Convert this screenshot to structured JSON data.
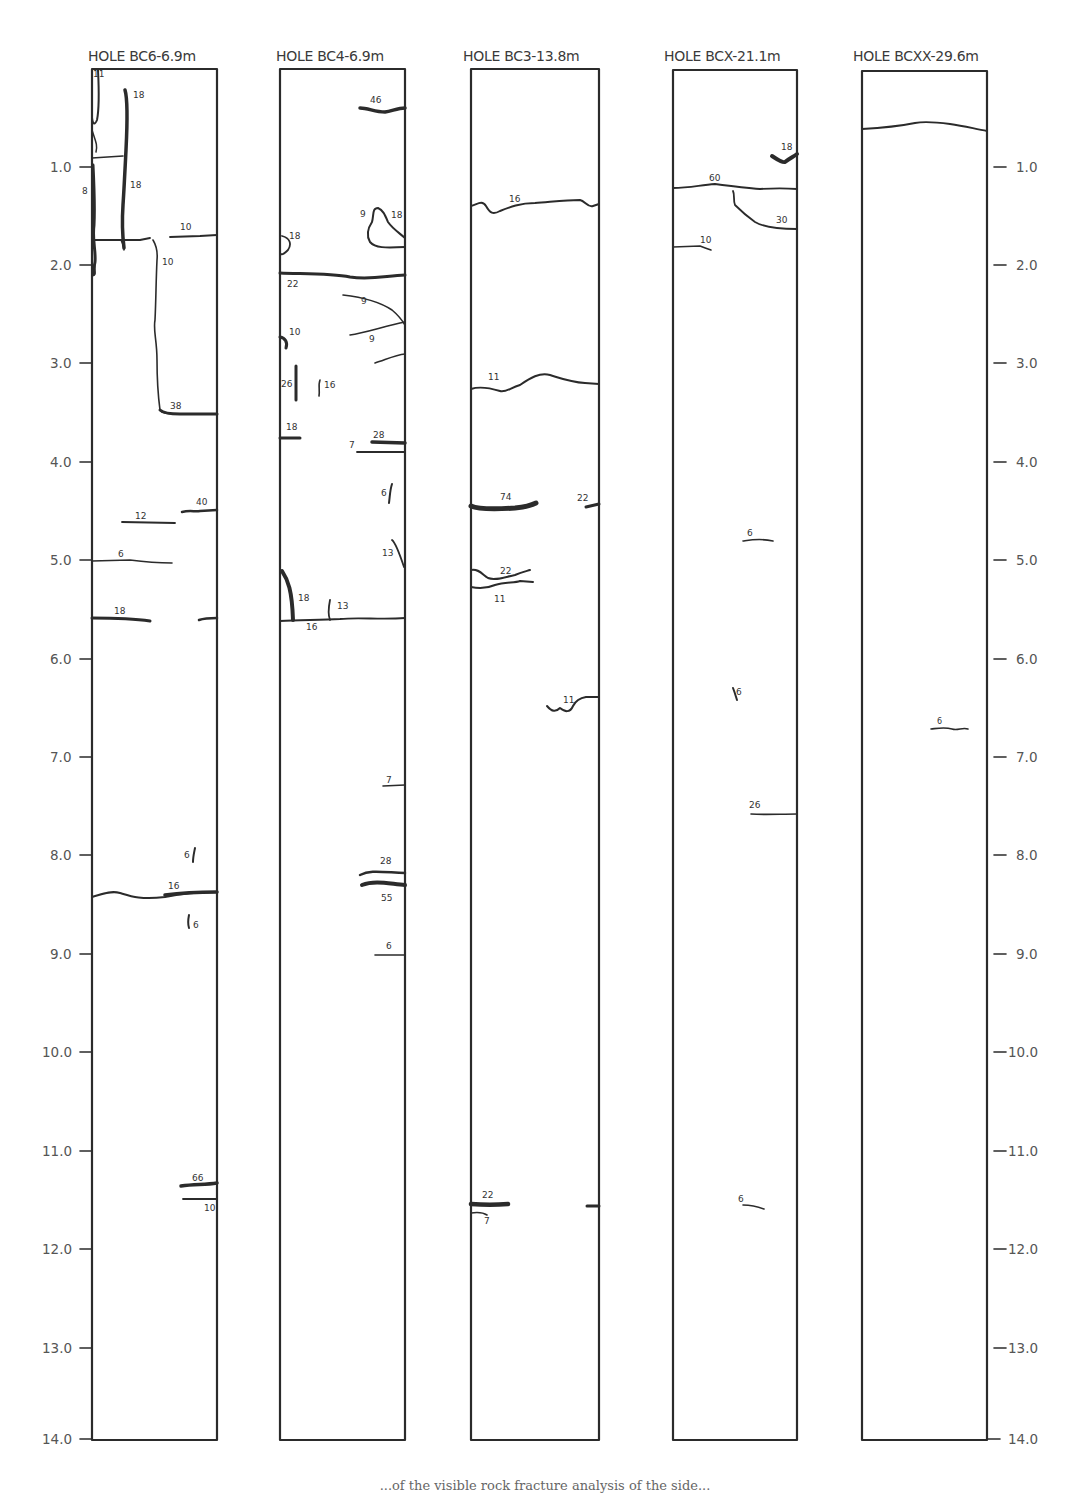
{
  "figure": {
    "type": "borehole-fracture-log",
    "depth_unit": "m",
    "depth_range": [
      0.0,
      14.0
    ],
    "left_axis_ticks": [
      "1.0",
      "2.0",
      "3.0",
      "4.0",
      "5.0",
      "6.0",
      "7.0",
      "8.0",
      "9.0",
      "10.0",
      "11.0",
      "12.0",
      "13.0",
      "14.0"
    ],
    "right_axis_ticks": [
      "1.0",
      "2.0",
      "3.0",
      "4.0",
      "5.0",
      "6.0",
      "7.0",
      "8.0",
      "9.0",
      "10.0",
      "11.0",
      "12.0",
      "13.0",
      "14.0"
    ],
    "caption": "...of the visible rock fracture analysis of the side..."
  },
  "holes": [
    {
      "id": "BC6",
      "title": "HOLE  BC6-6.9m",
      "fractures": [
        {
          "label": "11",
          "depth": 0.0
        },
        {
          "label": "18",
          "depth": 0.2
        },
        {
          "label": "18",
          "depth": 1.2
        },
        {
          "label": "8",
          "depth": 1.2
        },
        {
          "label": "10",
          "depth": 1.7
        },
        {
          "label": "10",
          "depth": 1.9
        },
        {
          "label": "38",
          "depth": 3.5
        },
        {
          "label": "40",
          "depth": 4.5
        },
        {
          "label": "12",
          "depth": 4.6
        },
        {
          "label": "6",
          "depth": 5.0
        },
        {
          "label": "18",
          "depth": 5.6
        },
        {
          "label": "6",
          "depth": 8.0
        },
        {
          "label": "16",
          "depth": 8.4
        },
        {
          "label": "6",
          "depth": 8.6
        },
        {
          "label": "66",
          "depth": 11.4
        },
        {
          "label": "10",
          "depth": 11.5
        }
      ]
    },
    {
      "id": "BC4",
      "title": "HOLE  BC4-6.9m",
      "fractures": [
        {
          "label": "46",
          "depth": 0.4
        },
        {
          "label": "9",
          "depth": 1.5
        },
        {
          "label": "18",
          "depth": 1.5
        },
        {
          "label": "18",
          "depth": 1.8
        },
        {
          "label": "22",
          "depth": 2.1
        },
        {
          "label": "9",
          "depth": 2.4
        },
        {
          "label": "9",
          "depth": 2.7
        },
        {
          "label": "10",
          "depth": 2.8
        },
        {
          "label": "26",
          "depth": 3.2
        },
        {
          "label": "16",
          "depth": 3.2
        },
        {
          "label": "18",
          "depth": 3.7
        },
        {
          "label": "28",
          "depth": 3.8
        },
        {
          "label": "7",
          "depth": 3.9
        },
        {
          "label": "6",
          "depth": 4.3
        },
        {
          "label": "13",
          "depth": 4.9
        },
        {
          "label": "18",
          "depth": 5.4
        },
        {
          "label": "13",
          "depth": 5.5
        },
        {
          "label": "16",
          "depth": 5.6
        },
        {
          "label": "7",
          "depth": 7.3
        },
        {
          "label": "28",
          "depth": 8.2
        },
        {
          "label": "55",
          "depth": 8.3
        },
        {
          "label": "6",
          "depth": 9.0
        }
      ]
    },
    {
      "id": "BC3",
      "title": "HOLE  BC3-13.8m",
      "fractures": [
        {
          "label": "16",
          "depth": 1.4
        },
        {
          "label": "11",
          "depth": 3.2
        },
        {
          "label": "74",
          "depth": 4.4
        },
        {
          "label": "22",
          "depth": 4.4
        },
        {
          "label": "22",
          "depth": 5.2
        },
        {
          "label": "11",
          "depth": 5.3
        },
        {
          "label": "11",
          "depth": 6.4
        },
        {
          "label": "22",
          "depth": 11.6
        },
        {
          "label": "7",
          "depth": 11.7
        }
      ]
    },
    {
      "id": "BCX",
      "title": "HOLE BCX-21.1m",
      "fractures": [
        {
          "label": "18",
          "depth": 0.9
        },
        {
          "label": "60",
          "depth": 1.2
        },
        {
          "label": "30",
          "depth": 1.6
        },
        {
          "label": "10",
          "depth": 1.8
        },
        {
          "label": "6",
          "depth": 4.8
        },
        {
          "label": "6",
          "depth": 6.4
        },
        {
          "label": "26",
          "depth": 7.6
        },
        {
          "label": "6",
          "depth": 11.6
        }
      ]
    },
    {
      "id": "BCXX",
      "title": "HOLE BCXX-29.6m",
      "fractures": [
        {
          "label": "",
          "depth": 0.6
        },
        {
          "label": "6",
          "depth": 6.7
        }
      ]
    }
  ]
}
